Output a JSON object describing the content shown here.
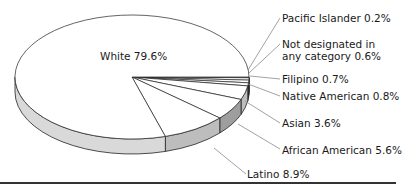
{
  "chart_data": {
    "type": "pie",
    "style": "3d-exploded-none",
    "title": "",
    "slices": [
      {
        "label": "White",
        "value": 79.6,
        "display": "White 79.6%"
      },
      {
        "label": "Latino",
        "value": 8.9,
        "display": "Latino 8.9%"
      },
      {
        "label": "African American",
        "value": 5.6,
        "display": "African American 5.6%"
      },
      {
        "label": "Asian",
        "value": 3.6,
        "display": "Asian 3.6%"
      },
      {
        "label": "Native American",
        "value": 0.8,
        "display": "Native American 0.8%"
      },
      {
        "label": "Filipino",
        "value": 0.7,
        "display": "Filipino 0.7%"
      },
      {
        "label": "Not designated in any category",
        "value": 0.6,
        "display": "Not designated in any category 0.6%"
      },
      {
        "label": "Pacific Islander",
        "value": 0.2,
        "display": "Pacific Islander 0.2%"
      }
    ],
    "unit": "%",
    "legend": "none (leader-line labels)",
    "colors": {
      "top": "#ffffff",
      "side_light": "#d9d9d9",
      "side_mid": "#bdbdbd",
      "side_dark": "#9e9e9e",
      "outline": "#222222",
      "leader": "#8a8a8a"
    }
  },
  "labels": {
    "white": "White 79.6%",
    "pacific": "Pacific Islander 0.2%",
    "notdesig": "Not designated in any category 0.6%",
    "filipino": "Filipino 0.7%",
    "native": "Native American 0.8%",
    "asian": "Asian 3.6%",
    "african": "African American 5.6%",
    "latino": "Latino 8.9%"
  }
}
